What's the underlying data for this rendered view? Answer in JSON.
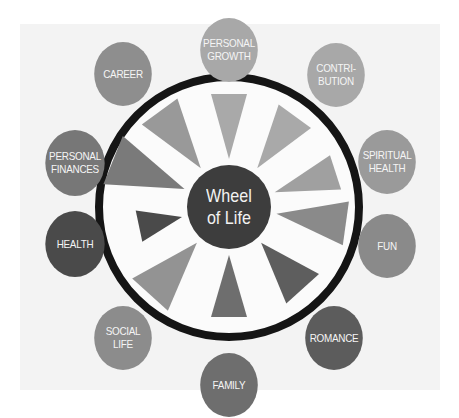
{
  "title": {
    "line1": "Wheel",
    "line2": "of Life",
    "color": "#3d3d3d"
  },
  "ring": {
    "color": "#151515"
  },
  "nodes": [
    {
      "id": "personal-growth",
      "label": "PERSONAL\nGROWTH",
      "color": "#a8a8a8"
    },
    {
      "id": "contribution",
      "label": "CONTRI-\nBUTION",
      "color": "#a8a8a8"
    },
    {
      "id": "spiritual-health",
      "label": "SPIRITUAL\nHEALTH",
      "color": "#9a9a9a"
    },
    {
      "id": "fun",
      "label": "FUN",
      "color": "#8a8a8a"
    },
    {
      "id": "romance",
      "label": "ROMANCE",
      "color": "#5c5c5c"
    },
    {
      "id": "family",
      "label": "FAMILY",
      "color": "#6e6e6e"
    },
    {
      "id": "social-life",
      "label": "SOCIAL\nLIFE",
      "color": "#8c8c8c"
    },
    {
      "id": "health",
      "label": "HEALTH",
      "color": "#4a4a4a"
    },
    {
      "id": "personal-finances",
      "label": "PERSONAL\nFINANCES",
      "color": "#777777"
    },
    {
      "id": "career",
      "label": "CAREER",
      "color": "#8e8e8e"
    }
  ],
  "wedges": [
    {
      "segment": "personal-growth",
      "color": "#a9a9a9"
    },
    {
      "segment": "contribution",
      "color": "#a9a9a9"
    },
    {
      "segment": "spiritual-health",
      "color": "#a0a0a0"
    },
    {
      "segment": "fun",
      "color": "#8a8a8a"
    },
    {
      "segment": "romance",
      "color": "#5e5e5e"
    },
    {
      "segment": "family",
      "color": "#6e6e6e"
    },
    {
      "segment": "social-life",
      "color": "#939393"
    },
    {
      "segment": "health",
      "color": "#4a4a4a"
    },
    {
      "segment": "personal-finances",
      "color": "#7a7a7a"
    },
    {
      "segment": "career",
      "color": "#999999"
    }
  ]
}
